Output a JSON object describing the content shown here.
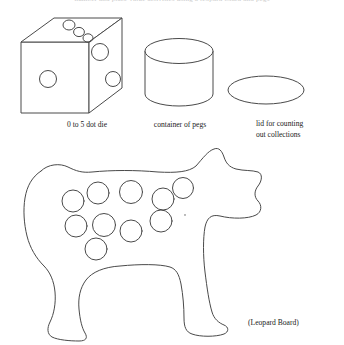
{
  "page": {
    "background_color": "#ffffff",
    "line_color": "#3b3b3b",
    "text_color": "#1a1a1a",
    "clipped_top_text": "number and place value activities  using a leopard board and pegs"
  },
  "captions": {
    "die": "0 to 5 dot die",
    "container": "container of pegs",
    "lid_line1": "lid for counting",
    "lid_line2": "out collections",
    "board": "(Leopard Board)"
  },
  "objects": [
    {
      "name": "dot-die",
      "shape": "cube-oblique",
      "label": "0 to 5 dot die",
      "faces": [
        {
          "face": "front",
          "dot_count": 1
        },
        {
          "face": "right",
          "dot_count": 2
        },
        {
          "face": "top",
          "dot_count": 3
        }
      ],
      "geometry": {
        "front_face": [
          [
            21,
            42
          ],
          [
            89,
            42
          ],
          [
            89,
            113
          ],
          [
            21,
            113
          ]
        ],
        "top_face": [
          [
            21,
            42
          ],
          [
            54,
            18
          ],
          [
            122,
            18
          ],
          [
            89,
            42
          ]
        ],
        "right_face": [
          [
            89,
            42
          ],
          [
            122,
            18
          ],
          [
            122,
            88
          ],
          [
            89,
            113
          ]
        ]
      },
      "dots": [
        {
          "face": "front",
          "cx": 48,
          "cy": 79,
          "r": 8
        },
        {
          "face": "right",
          "cx": 100,
          "cy": 52,
          "r": 8
        },
        {
          "face": "right",
          "cx": 113,
          "cy": 79,
          "r": 7.5
        },
        {
          "face": "top",
          "cx": 69,
          "cy": 25,
          "r": 5.5
        },
        {
          "face": "top",
          "cx": 79,
          "cy": 31,
          "r": 5
        },
        {
          "face": "top",
          "cx": 88,
          "cy": 37,
          "r": 4.5
        }
      ]
    },
    {
      "name": "peg-container",
      "shape": "cylinder",
      "label": "container of pegs",
      "geometry": {
        "center_x": 179,
        "top_ellipse_cy": 51,
        "bottom_ellipse_cy": 94,
        "rx": 34,
        "ry": 12
      }
    },
    {
      "name": "counting-lid",
      "shape": "ellipse",
      "label": "lid for counting out collections",
      "geometry": {
        "cx": 266,
        "cy": 90,
        "rx": 38,
        "ry": 14
      }
    },
    {
      "name": "leopard-board",
      "shape": "animal-silhouette",
      "label": "(Leopard Board)",
      "hole_count": 11,
      "holes": [
        {
          "cx": 73,
          "cy": 201,
          "r": 10.5
        },
        {
          "cx": 97,
          "cy": 193,
          "r": 10.5
        },
        {
          "cx": 131,
          "cy": 192,
          "r": 10.5
        },
        {
          "cx": 163,
          "cy": 198,
          "r": 10.5
        },
        {
          "cx": 182,
          "cy": 188,
          "r": 10.5
        },
        {
          "cx": 99,
          "cy": 224,
          "r": 10.5
        },
        {
          "cx": 124,
          "cy": 222,
          "r": 10.5
        },
        {
          "cx": 149,
          "cy": 229,
          "r": 10.5
        },
        {
          "cx": 179,
          "cy": 223,
          "r": 10.5
        },
        {
          "cx": 111,
          "cy": 245,
          "r": 10.5
        },
        {
          "cx": 76,
          "cy": 229,
          "r": 0
        }
      ]
    }
  ]
}
